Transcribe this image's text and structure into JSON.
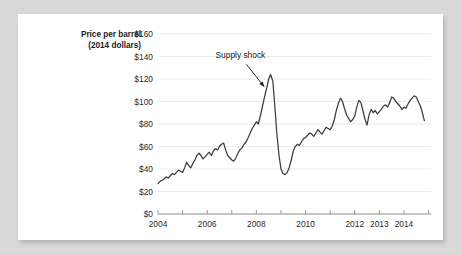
{
  "card": {
    "background_color": "#ffffff",
    "page_background_color": "#d8d8d8"
  },
  "chart_data": {
    "type": "line",
    "title": "",
    "subtitle": "",
    "xlabel": "",
    "ylabel": "Price per barrel (2014 dollars)",
    "ylabel_line1": "Price per barrel",
    "ylabel_line2": "(2014 dollars)",
    "xlim": [
      2004,
      2015.1
    ],
    "ylim": [
      0,
      160
    ],
    "grid": true,
    "grid_axis": "y",
    "legend": "none",
    "line_color": "#3d3d3d",
    "gridline_color": "#e6e6e6",
    "axis_color": "#8d8d8d",
    "y_ticks": [
      0,
      20,
      40,
      60,
      80,
      100,
      120,
      140,
      160
    ],
    "y_tick_labels": [
      "$0",
      "$20",
      "$40",
      "$60",
      "$80",
      "$100",
      "$120",
      "$140",
      "$160"
    ],
    "x_ticks": [
      2004,
      2005,
      2006,
      2007,
      2008,
      2009,
      2010,
      2011,
      2012,
      2013,
      2014,
      2015
    ],
    "x_tick_labels_shown": [
      "2004",
      "2006",
      "2008",
      "2010",
      "2012",
      "2013",
      "2014"
    ],
    "x_tick_label_positions": [
      2004,
      2006,
      2008,
      2010,
      2012,
      2013,
      2014
    ],
    "annotations": [
      {
        "text": "Supply shock",
        "label_x": 2007.35,
        "label_y": 139,
        "arrow_from_x": 2007.6,
        "arrow_from_y": 133,
        "arrow_to_x": 2008.32,
        "arrow_to_y": 113
      }
    ],
    "series": [
      {
        "name": "Crude oil price",
        "x": [
          2004.0,
          2004.08,
          2004.17,
          2004.25,
          2004.33,
          2004.42,
          2004.5,
          2004.58,
          2004.67,
          2004.75,
          2004.83,
          2004.92,
          2005.0,
          2005.08,
          2005.17,
          2005.25,
          2005.33,
          2005.42,
          2005.5,
          2005.58,
          2005.67,
          2005.75,
          2005.83,
          2005.92,
          2006.0,
          2006.08,
          2006.17,
          2006.25,
          2006.33,
          2006.42,
          2006.5,
          2006.58,
          2006.67,
          2006.75,
          2006.83,
          2006.92,
          2007.0,
          2007.08,
          2007.17,
          2007.25,
          2007.33,
          2007.42,
          2007.5,
          2007.58,
          2007.67,
          2007.75,
          2007.83,
          2007.92,
          2008.0,
          2008.08,
          2008.17,
          2008.25,
          2008.33,
          2008.42,
          2008.5,
          2008.58,
          2008.67,
          2008.75,
          2008.83,
          2008.92,
          2009.0,
          2009.08,
          2009.17,
          2009.25,
          2009.33,
          2009.42,
          2009.5,
          2009.58,
          2009.67,
          2009.75,
          2009.83,
          2009.92,
          2010.0,
          2010.08,
          2010.17,
          2010.25,
          2010.33,
          2010.42,
          2010.5,
          2010.58,
          2010.67,
          2010.75,
          2010.83,
          2010.92,
          2011.0,
          2011.08,
          2011.17,
          2011.25,
          2011.33,
          2011.42,
          2011.5,
          2011.58,
          2011.67,
          2011.75,
          2011.83,
          2011.92,
          2012.0,
          2012.08,
          2012.17,
          2012.25,
          2012.33,
          2012.42,
          2012.5,
          2012.58,
          2012.67,
          2012.75,
          2012.83,
          2012.92,
          2013.0,
          2013.08,
          2013.17,
          2013.25,
          2013.33,
          2013.42,
          2013.5,
          2013.58,
          2013.67,
          2013.75,
          2013.83,
          2013.92,
          2014.0,
          2014.08,
          2014.17,
          2014.25,
          2014.33,
          2014.42,
          2014.5,
          2014.58,
          2014.67,
          2014.75,
          2014.83
        ],
        "values": [
          27,
          29,
          30,
          31,
          33,
          32,
          34,
          36,
          35,
          37,
          39,
          38,
          37,
          41,
          46,
          43,
          41,
          45,
          48,
          52,
          54,
          52,
          49,
          51,
          53,
          55,
          52,
          56,
          58,
          57,
          60,
          62,
          63,
          57,
          52,
          50,
          48,
          47,
          50,
          54,
          57,
          59,
          62,
          64,
          68,
          72,
          76,
          79,
          82,
          80,
          88,
          96,
          104,
          112,
          120,
          124,
          118,
          96,
          72,
          52,
          40,
          36,
          35,
          37,
          41,
          48,
          56,
          60,
          62,
          61,
          64,
          67,
          68,
          70,
          72,
          71,
          69,
          72,
          75,
          73,
          71,
          74,
          77,
          76,
          75,
          78,
          84,
          92,
          98,
          103,
          100,
          94,
          88,
          85,
          82,
          84,
          87,
          95,
          101,
          99,
          92,
          84,
          79,
          88,
          93,
          90,
          92,
          89,
          91,
          93,
          96,
          97,
          95,
          99,
          104,
          103,
          100,
          98,
          96,
          93,
          95,
          94,
          98,
          101,
          103,
          105,
          104,
          100,
          96,
          90,
          83
        ]
      }
    ]
  }
}
